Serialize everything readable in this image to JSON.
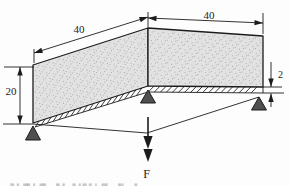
{
  "labels": {
    "dim_top_left": "40",
    "dim_top_right": "40",
    "dim_left": "20",
    "dim_right": "2",
    "force_label": "F"
  },
  "colors": {
    "line": "#1c1c1c",
    "plate_fill": "#e2e2e2",
    "stipple": "#a8a8a8",
    "support_fill": "#4f4f4f",
    "background": "#fdfdfd",
    "caption_fragment": "#9a9a9a"
  }
}
